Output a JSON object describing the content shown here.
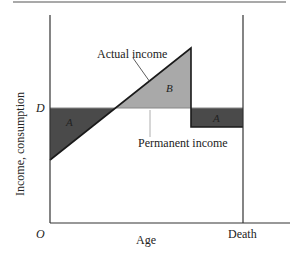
{
  "diagram": {
    "y_axis_label": "Income, consumption",
    "x_axis_label": "Age",
    "origin_label": "O",
    "level_label": "D",
    "end_label": "Death",
    "curve_labels": {
      "actual": "Actual income",
      "permanent": "Permanent income"
    },
    "region_labels": {
      "left_deficit": "A",
      "surplus": "B",
      "right_deficit": "A"
    },
    "colors": {
      "dark_region": "#4a4a4a",
      "light_region": "#a9a9a9",
      "line": "#1a1a1a",
      "permanent_line": "#777777"
    }
  }
}
